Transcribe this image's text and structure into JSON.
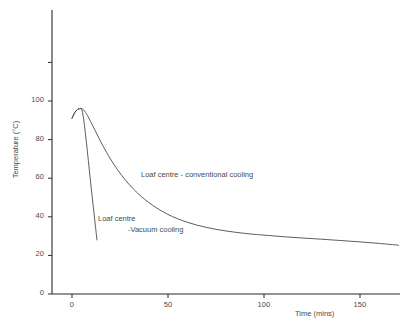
{
  "chart_data": {
    "type": "line",
    "title": "",
    "xlabel": "Time (mins)",
    "ylabel": "Temperature (°C)",
    "xlim": [
      -3,
      172
    ],
    "ylim": [
      0,
      145
    ],
    "xticks": [
      0,
      50,
      100,
      150
    ],
    "xtick_labels": [
      "0",
      "50",
      "100",
      "150"
    ],
    "yticks": [
      0,
      20,
      40,
      60,
      80,
      100,
      120
    ],
    "ytick_labels": [
      "0",
      "20",
      "40",
      "60",
      "80",
      "100",
      ""
    ],
    "grid": false,
    "legend": "none",
    "annotations": [
      {
        "name": "conventional-cooling-label",
        "text": "Loaf centre - conventional cooling",
        "x": 33,
        "y": 57
      },
      {
        "name": "vacuum-cooling-label",
        "line1": "Loaf centre",
        "line2": "-Vacuum cooling",
        "x": 11,
        "y": 35
      }
    ],
    "series": [
      {
        "name": "Loaf centre - conventional cooling",
        "color": "#4a4a4a",
        "x": [
          0,
          1,
          2,
          3,
          4,
          5,
          6,
          7,
          8,
          10,
          12,
          14,
          16,
          18,
          20,
          24,
          28,
          32,
          36,
          40,
          45,
          50,
          55,
          60,
          65,
          70,
          75,
          80,
          85,
          90,
          95,
          100,
          110,
          120,
          130,
          140,
          150,
          160,
          170
        ],
        "y": [
          91.0,
          93.2,
          94.8,
          95.7,
          96.0,
          96.0,
          95.4,
          94.2,
          92.6,
          88.8,
          84.8,
          80.8,
          77.0,
          73.4,
          70.0,
          64.0,
          58.8,
          54.4,
          50.6,
          47.4,
          44.0,
          41.2,
          39.0,
          37.2,
          35.7,
          34.5,
          33.5,
          32.7,
          32.0,
          31.4,
          30.9,
          30.5,
          29.7,
          29.0,
          28.4,
          27.7,
          27.0,
          26.2,
          25.3
        ]
      },
      {
        "name": "Loaf centre -Vacuum cooling",
        "color": "#4a4a4a",
        "x": [
          0,
          1,
          2,
          3,
          4,
          5,
          6,
          7,
          8,
          9,
          10,
          11,
          12,
          13
        ],
        "y": [
          91.0,
          93.2,
          94.8,
          95.7,
          96.0,
          95.8,
          91.0,
          83.0,
          74.0,
          64.5,
          55.0,
          46.0,
          37.0,
          28.0
        ]
      }
    ]
  }
}
